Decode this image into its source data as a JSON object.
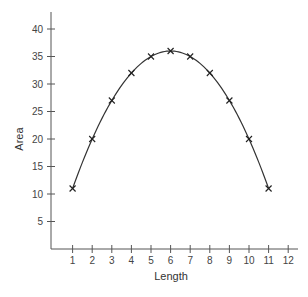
{
  "chart_data": {
    "type": "line",
    "title": "",
    "xlabel": "Length",
    "ylabel": "Area",
    "x": [
      1,
      2,
      3,
      4,
      5,
      6,
      7,
      8,
      9,
      10,
      11
    ],
    "values": [
      11,
      20,
      27,
      32,
      35,
      36,
      35,
      32,
      27,
      20,
      11
    ],
    "x_ticks": [
      1,
      2,
      3,
      4,
      5,
      6,
      7,
      8,
      9,
      10,
      11,
      12
    ],
    "y_ticks": [
      5,
      10,
      15,
      20,
      25,
      30,
      35,
      40
    ],
    "xlim": [
      0,
      12.5
    ],
    "ylim": [
      0,
      43
    ],
    "grid": false,
    "marker": "x",
    "curve": "smooth",
    "line_color": "#333333"
  }
}
